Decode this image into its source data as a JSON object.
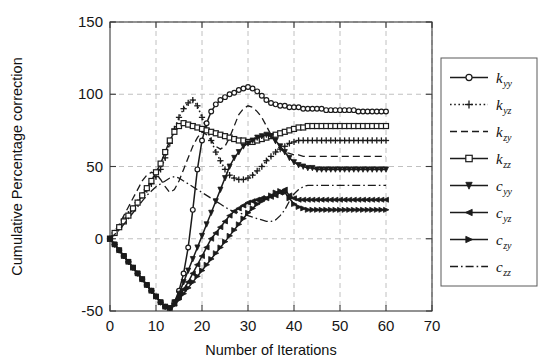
{
  "chart_data": {
    "type": "line",
    "title": "",
    "xlabel": "Number of Iterations",
    "ylabel": "Cumulative Percentage correction",
    "xlim": [
      0,
      70
    ],
    "ylim": [
      -50,
      150
    ],
    "xticks": [
      0,
      10,
      20,
      30,
      40,
      50,
      60,
      70
    ],
    "yticks": [
      -50,
      0,
      50,
      100,
      150
    ],
    "grid": true,
    "legend_position": "right-outside",
    "background": "#ffffff",
    "line_color": "#1b1b1b",
    "x": [
      0,
      1,
      2,
      3,
      4,
      5,
      6,
      7,
      8,
      9,
      10,
      11,
      12,
      13,
      14,
      15,
      16,
      17,
      18,
      19,
      20,
      21,
      22,
      23,
      24,
      25,
      26,
      27,
      28,
      29,
      30,
      31,
      32,
      33,
      34,
      35,
      36,
      37,
      38,
      39,
      40,
      41,
      42,
      43,
      44,
      45,
      46,
      47,
      48,
      49,
      50,
      51,
      52,
      53,
      54,
      55,
      56,
      57,
      58,
      59,
      60
    ],
    "series": [
      {
        "name": "k_yy",
        "label": "k",
        "subscript": "yy",
        "marker": "circle",
        "linestyle": "solid",
        "values": [
          0,
          -4,
          -8,
          -12,
          -16,
          -20,
          -24,
          -28,
          -32,
          -36,
          -40,
          -44,
          -47,
          -48,
          -44,
          -36,
          -24,
          -6,
          20,
          48,
          68,
          80,
          88,
          93,
          96,
          98,
          100,
          101,
          103,
          104,
          105,
          104,
          102,
          99,
          96,
          94,
          93,
          92,
          92,
          91,
          91,
          91,
          90,
          90,
          90,
          90,
          90,
          89,
          89,
          89,
          89,
          89,
          89,
          89,
          88,
          88,
          88,
          88,
          88,
          88,
          88
        ]
      },
      {
        "name": "k_yz",
        "label": "k",
        "subscript": "yz",
        "marker": "plus",
        "linestyle": "dotted",
        "values": [
          0,
          4,
          8,
          13,
          17,
          21,
          25,
          30,
          34,
          38,
          43,
          48,
          56,
          66,
          76,
          84,
          90,
          94,
          96,
          92,
          84,
          76,
          68,
          60,
          54,
          48,
          44,
          42,
          41,
          41,
          42,
          44,
          47,
          50,
          54,
          57,
          60,
          62,
          64,
          66,
          67,
          68,
          68,
          68,
          68,
          68,
          68,
          68,
          68,
          68,
          68,
          68,
          68,
          68,
          68,
          68,
          68,
          68,
          68,
          68,
          68
        ]
      },
      {
        "name": "k_zy",
        "label": "k",
        "subscript": "zy",
        "marker": "none",
        "linestyle": "dashed",
        "values": [
          0,
          5,
          10,
          16,
          22,
          28,
          34,
          40,
          44,
          46,
          45,
          41,
          36,
          32,
          34,
          40,
          48,
          56,
          64,
          70,
          74,
          72,
          68,
          64,
          62,
          64,
          70,
          78,
          86,
          90,
          92,
          91,
          88,
          84,
          78,
          72,
          66,
          62,
          60,
          59,
          58,
          58,
          57,
          57,
          57,
          57,
          57,
          57,
          57,
          57,
          57,
          57,
          57,
          57,
          57,
          57,
          57,
          57,
          57,
          57,
          57
        ]
      },
      {
        "name": "k_zz",
        "label": "k",
        "subscript": "zz",
        "marker": "square",
        "linestyle": "solid",
        "values": [
          0,
          4,
          8,
          12,
          16,
          21,
          25,
          30,
          35,
          40,
          46,
          52,
          60,
          68,
          74,
          78,
          80,
          79,
          78,
          77,
          76,
          75,
          74,
          73,
          72,
          71,
          70,
          69,
          68,
          68,
          67,
          67,
          68,
          69,
          70,
          71,
          72,
          73,
          74,
          75,
          76,
          77,
          77,
          78,
          78,
          78,
          78,
          78,
          78,
          78,
          78,
          78,
          78,
          78,
          78,
          78,
          78,
          78,
          78,
          78,
          78
        ]
      },
      {
        "name": "c_yy",
        "label": "c",
        "subscript": "yy",
        "marker": "triangle-down",
        "linestyle": "solid",
        "values": [
          0,
          -4,
          -8,
          -12,
          -16,
          -20,
          -24,
          -28,
          -32,
          -36,
          -40,
          -44,
          -47,
          -48,
          -44,
          -38,
          -30,
          -22,
          -14,
          -6,
          2,
          10,
          18,
          26,
          34,
          42,
          50,
          56,
          60,
          64,
          66,
          68,
          70,
          71,
          72,
          71,
          68,
          64,
          60,
          56,
          53,
          51,
          50,
          49,
          49,
          48,
          48,
          48,
          48,
          48,
          48,
          48,
          48,
          48,
          48,
          48,
          48,
          48,
          48,
          48,
          48
        ]
      },
      {
        "name": "c_yz",
        "label": "c",
        "subscript": "yz",
        "marker": "triangle-left",
        "linestyle": "solid",
        "values": [
          0,
          -4,
          -8,
          -12,
          -16,
          -20,
          -24,
          -28,
          -32,
          -36,
          -40,
          -44,
          -47,
          -48,
          -45,
          -40,
          -35,
          -30,
          -24,
          -18,
          -12,
          -6,
          0,
          4,
          8,
          12,
          16,
          19,
          21,
          23,
          25,
          26,
          27,
          28,
          28,
          29,
          30,
          32,
          34,
          30,
          28,
          27,
          27,
          27,
          27,
          27,
          27,
          27,
          27,
          27,
          27,
          27,
          27,
          27,
          27,
          27,
          27,
          27,
          27,
          27,
          27
        ]
      },
      {
        "name": "c_zy",
        "label": "c",
        "subscript": "zy",
        "marker": "triangle-right",
        "linestyle": "solid",
        "values": [
          0,
          -4,
          -8,
          -12,
          -16,
          -20,
          -24,
          -28,
          -32,
          -36,
          -40,
          -44,
          -47,
          -48,
          -46,
          -42,
          -38,
          -34,
          -30,
          -26,
          -22,
          -18,
          -14,
          -10,
          -6,
          -2,
          2,
          6,
          10,
          14,
          18,
          21,
          24,
          26,
          28,
          30,
          32,
          33,
          32,
          28,
          24,
          22,
          21,
          20,
          20,
          20,
          20,
          20,
          20,
          20,
          20,
          20,
          20,
          20,
          20,
          20,
          20,
          20,
          20,
          20,
          20
        ]
      },
      {
        "name": "c_zz",
        "label": "c",
        "subscript": "zz",
        "marker": "none",
        "linestyle": "dashdot",
        "values": [
          0,
          3,
          6,
          10,
          14,
          18,
          22,
          26,
          30,
          33,
          36,
          38,
          40,
          42,
          43,
          42,
          40,
          38,
          36,
          34,
          32,
          30,
          28,
          26,
          24,
          22,
          20,
          19,
          18,
          17,
          16,
          15,
          14,
          13,
          12,
          12,
          13,
          16,
          20,
          26,
          31,
          34,
          36,
          37,
          37,
          37,
          37,
          37,
          37,
          37,
          37,
          37,
          37,
          37,
          37,
          37,
          37,
          37,
          37,
          37,
          37
        ]
      }
    ]
  },
  "legend": {
    "entries": [
      {
        "label": "k",
        "subscript": "yy"
      },
      {
        "label": "k",
        "subscript": "yz"
      },
      {
        "label": "k",
        "subscript": "zy"
      },
      {
        "label": "k",
        "subscript": "zz"
      },
      {
        "label": "c",
        "subscript": "yy"
      },
      {
        "label": "c",
        "subscript": "yz"
      },
      {
        "label": "c",
        "subscript": "zy"
      },
      {
        "label": "c",
        "subscript": "zz"
      }
    ]
  }
}
